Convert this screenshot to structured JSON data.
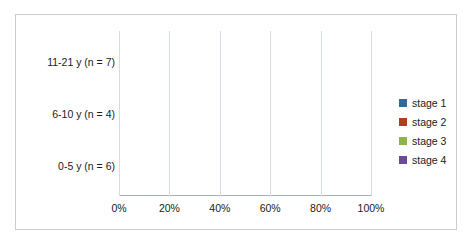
{
  "chart_data": {
    "type": "bar",
    "orientation": "horizontal",
    "stacked": true,
    "normalized": "100%",
    "title": "",
    "xlabel": "",
    "ylabel": "",
    "categories": [
      "0-5 y  (n = 6)",
      "6-10 y  (n = 4)",
      "11-21 y  (n = 7)"
    ],
    "series": [
      {
        "name": "stage 1",
        "color": "#31699F",
        "values": [
          66.7,
          25.0,
          42.9
        ]
      },
      {
        "name": "stage 2",
        "color": "#B23B22",
        "values": [
          33.3,
          25.0,
          14.3
        ]
      },
      {
        "name": "stage 3",
        "color": "#8FB34D",
        "values": [
          0.0,
          50.0,
          14.3
        ]
      },
      {
        "name": "stage 4",
        "color": "#6A4C93",
        "values": [
          0.0,
          0.0,
          28.6
        ]
      }
    ],
    "xticklabels": [
      "0%",
      "20%",
      "40%",
      "60%",
      "80%",
      "100%"
    ],
    "xtickvalues": [
      0,
      20,
      40,
      60,
      80,
      100
    ],
    "xlim": [
      0,
      100
    ],
    "grid": "vertical",
    "legend_position": "right"
  },
  "axis": {
    "ticks": [
      {
        "label": "0%",
        "value": 0
      },
      {
        "label": "20%",
        "value": 20
      },
      {
        "label": "40%",
        "value": 40
      },
      {
        "label": "60%",
        "value": 60
      },
      {
        "label": "80%",
        "value": 80
      },
      {
        "label": "100%",
        "value": 100
      }
    ]
  },
  "categories": [
    {
      "label": "0-5 y  (n = 6)"
    },
    {
      "label": "6-10 y  (n = 4)"
    },
    {
      "label": "11-21 y  (n = 7)"
    }
  ],
  "legend": {
    "items": [
      {
        "label": "stage 1",
        "color": "#31699F"
      },
      {
        "label": "stage 2",
        "color": "#B23B22"
      },
      {
        "label": "stage 3",
        "color": "#8FB34D"
      },
      {
        "label": "stage 4",
        "color": "#6A4C93"
      }
    ]
  }
}
